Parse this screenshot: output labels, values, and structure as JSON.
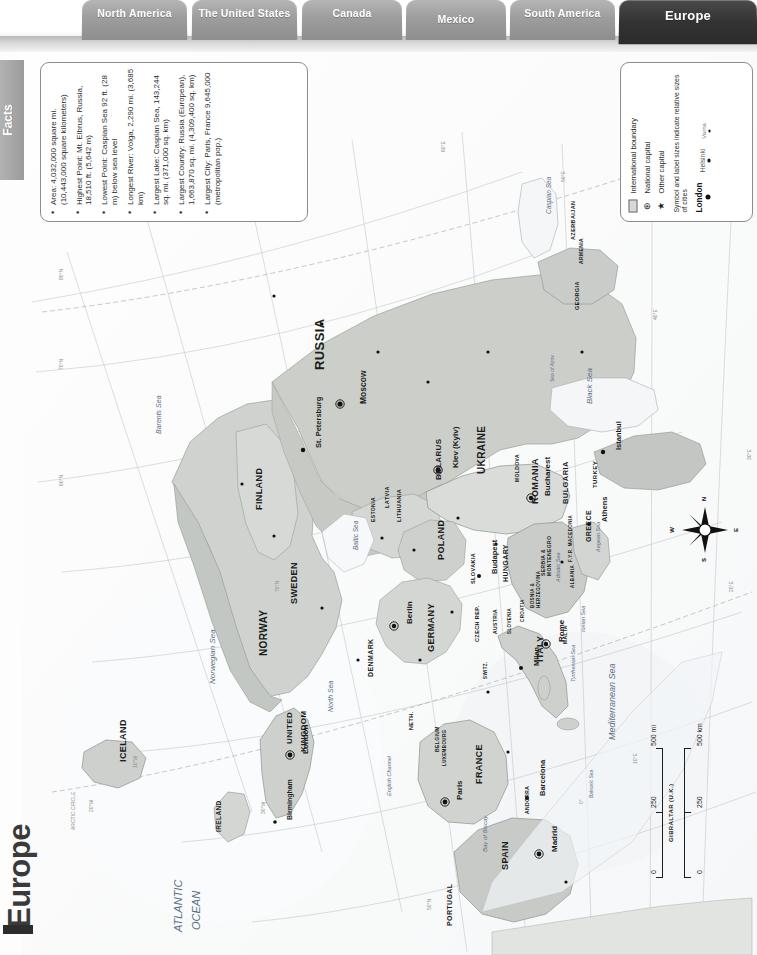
{
  "tabs": [
    {
      "label": "North America",
      "active": false
    },
    {
      "label": "The United States",
      "active": false
    },
    {
      "label": "Canada",
      "active": false
    },
    {
      "label": "Mexico",
      "active": false
    },
    {
      "label": "South America",
      "active": false
    },
    {
      "label": "Europe",
      "active": true
    }
  ],
  "side_tab": {
    "label": "Facts"
  },
  "page_title": "Europe",
  "facts": {
    "items": [
      "Area: 4,032,000 square mi. (10,443,000 square kilometers)",
      "Highest Point: Mt. Elbrus, Russia, 18,510 ft. (5,642 m)",
      "Lowest Point: Caspian Sea 92 ft. (28 m) below sea level",
      "Longest River: Volga, 2,290 mi. (3,685 km)",
      "Largest Lake: Caspian Sea, 143,244 sq. mi. (371,000 sq. km)",
      "Largest Country: Russia (European), 1,663,870 sq. mi. (4,309,400 sq. km)",
      "Largest City: Paris, France 9,645,000 (metropolitan pop.)"
    ]
  },
  "legend": {
    "boundary_label": "International boundary",
    "national_capital_label": "National capital",
    "other_capital_label": "Other capital",
    "note": "Symbol and label sizes indicate relative sizes of cities",
    "cities": [
      {
        "name": "London",
        "size": "big"
      },
      {
        "name": "Helsinki",
        "size": "mid"
      },
      {
        "name": "Varna",
        "size": "small"
      }
    ],
    "national_capital_glyph": "⊛",
    "other_capital_glyph": "★"
  },
  "scale": {
    "miles_ticks": [
      "0",
      "250",
      "500 mi"
    ],
    "km_ticks": [
      "0",
      "250",
      "500 km"
    ]
  },
  "compass": {
    "n": "N",
    "e": "E",
    "s": "S",
    "w": "W"
  },
  "map": {
    "ocean_label_1": "ATLANTIC",
    "ocean_label_2": "OCEAN",
    "countries": [
      {
        "name": "ICELAND",
        "x": 96,
        "y": 710,
        "size": 9,
        "rot": -90
      },
      {
        "name": "IRELAND",
        "x": 193,
        "y": 780,
        "size": 6.5,
        "rot": -90
      },
      {
        "name": "UNITED",
        "x": 263,
        "y": 692,
        "size": 8,
        "rot": -90
      },
      {
        "name": "KINGDOM",
        "x": 277,
        "y": 700,
        "size": 8,
        "rot": -90
      },
      {
        "name": "PORTUGAL",
        "x": 424,
        "y": 874,
        "size": 7,
        "rot": -90
      },
      {
        "name": "SPAIN",
        "x": 478,
        "y": 818,
        "size": 9,
        "rot": -90
      },
      {
        "name": "FRANCE",
        "x": 452,
        "y": 732,
        "size": 9,
        "rot": -90
      },
      {
        "name": "ANDORRA",
        "x": 502,
        "y": 762,
        "size": 5,
        "rot": -90
      },
      {
        "name": "NORWAY",
        "x": 236,
        "y": 604,
        "size": 10,
        "rot": -90
      },
      {
        "name": "SWEDEN",
        "x": 267,
        "y": 552,
        "size": 9,
        "rot": -90
      },
      {
        "name": "FINLAND",
        "x": 232,
        "y": 458,
        "size": 9,
        "rot": -90
      },
      {
        "name": "DENMARK",
        "x": 345,
        "y": 625,
        "size": 7,
        "rot": -90
      },
      {
        "name": "NETH.",
        "x": 386,
        "y": 678,
        "size": 5.5,
        "rot": -90
      },
      {
        "name": "BELGIUM",
        "x": 412,
        "y": 700,
        "size": 5,
        "rot": -90
      },
      {
        "name": "LUXEMBOURG",
        "x": 420,
        "y": 714,
        "size": 4.5,
        "rot": -90
      },
      {
        "name": "GERMANY",
        "x": 404,
        "y": 600,
        "size": 9,
        "rot": -90
      },
      {
        "name": "POLAND",
        "x": 414,
        "y": 508,
        "size": 9,
        "rot": -90
      },
      {
        "name": "CZECH REP.",
        "x": 452,
        "y": 590,
        "size": 5.5,
        "rot": -90
      },
      {
        "name": "SLOVAKIA",
        "x": 448,
        "y": 532,
        "size": 5.5,
        "rot": -90
      },
      {
        "name": "AUSTRIA",
        "x": 470,
        "y": 582,
        "size": 5,
        "rot": -90
      },
      {
        "name": "SWITZ.",
        "x": 461,
        "y": 627,
        "size": 4.5,
        "rot": -90
      },
      {
        "name": "HUNGARY",
        "x": 480,
        "y": 530,
        "size": 7,
        "rot": -90
      },
      {
        "name": "SLOVENIA",
        "x": 485,
        "y": 582,
        "size": 4.5,
        "rot": -90
      },
      {
        "name": "CROATIA",
        "x": 498,
        "y": 570,
        "size": 4.5,
        "rot": -90
      },
      {
        "name": "BOSNIA &",
        "x": 508,
        "y": 556,
        "size": 4.5,
        "rot": -90
      },
      {
        "name": "HERZEGOVINA",
        "x": 514,
        "y": 556,
        "size": 4.5,
        "rot": -90
      },
      {
        "name": "SERBIA &",
        "x": 518,
        "y": 524,
        "size": 5,
        "rot": -90
      },
      {
        "name": "MONTENEGRO",
        "x": 524,
        "y": 524,
        "size": 5,
        "rot": -90
      },
      {
        "name": "ITALY",
        "x": 513,
        "y": 610,
        "size": 9,
        "rot": -90
      },
      {
        "name": "ROMANIA",
        "x": 508,
        "y": 452,
        "size": 9,
        "rot": -90
      },
      {
        "name": "MOLDOVA",
        "x": 492,
        "y": 430,
        "size": 5,
        "rot": -90
      },
      {
        "name": "BULGARIA",
        "x": 539,
        "y": 452,
        "size": 7.5,
        "rot": -90
      },
      {
        "name": "F.Y.R. MACEDONIA",
        "x": 546,
        "y": 510,
        "size": 4.5,
        "rot": -90
      },
      {
        "name": "ALBANIA",
        "x": 548,
        "y": 536,
        "size": 4.5,
        "rot": -90
      },
      {
        "name": "GREECE",
        "x": 563,
        "y": 490,
        "size": 7,
        "rot": -90
      },
      {
        "name": "TURKEY",
        "x": 570,
        "y": 436,
        "size": 6,
        "rot": -90
      },
      {
        "name": "UKRAINE",
        "x": 454,
        "y": 422,
        "size": 10,
        "rot": -90
      },
      {
        "name": "BELARUS",
        "x": 412,
        "y": 428,
        "size": 8,
        "rot": -90
      },
      {
        "name": "LITHUANIA",
        "x": 374,
        "y": 470,
        "size": 5.5,
        "rot": -90
      },
      {
        "name": "LATVIA",
        "x": 362,
        "y": 456,
        "size": 5.5,
        "rot": -90
      },
      {
        "name": "ESTONIA",
        "x": 348,
        "y": 470,
        "size": 5,
        "rot": -90
      },
      {
        "name": "RUSSIA",
        "x": 290,
        "y": 318,
        "size": 13,
        "rot": -90
      },
      {
        "name": "GEORGIA",
        "x": 552,
        "y": 258,
        "size": 5.5,
        "rot": -90
      },
      {
        "name": "ARMENIA",
        "x": 556,
        "y": 212,
        "size": 5,
        "rot": -90
      },
      {
        "name": "AZERBAIJAN",
        "x": 548,
        "y": 188,
        "size": 5.5,
        "rot": -90
      },
      {
        "name": "MALTA",
        "x": 540,
        "y": 592,
        "size": 5,
        "rot": -90
      },
      {
        "name": "GIBRALTAR (U.K.)",
        "x": 646,
        "y": 790,
        "size": 6,
        "rot": -90
      }
    ],
    "capitals": [
      {
        "name": "Moscow",
        "x": 336,
        "y": 352,
        "size": 8.5
      },
      {
        "name": "Kiev (Kyiv)",
        "x": 429,
        "y": 416,
        "size": 8
      },
      {
        "name": "London",
        "x": 279,
        "y": 702,
        "size": 8
      },
      {
        "name": "Paris",
        "x": 433,
        "y": 748,
        "size": 8
      },
      {
        "name": "Madrid",
        "x": 528,
        "y": 800,
        "size": 8
      },
      {
        "name": "Berlin",
        "x": 383,
        "y": 572,
        "size": 8
      },
      {
        "name": "Rome",
        "x": 535,
        "y": 590,
        "size": 8
      },
      {
        "name": "Bucharest",
        "x": 521,
        "y": 444,
        "size": 8
      },
      {
        "name": "Budapest",
        "x": 468,
        "y": 522,
        "size": 7.5
      },
      {
        "name": "Athens",
        "x": 578,
        "y": 470,
        "size": 7.5
      },
      {
        "name": "St. Petersburg",
        "x": 292,
        "y": 396,
        "size": 7.5
      },
      {
        "name": "Istanbul",
        "x": 592,
        "y": 398,
        "size": 7.5
      },
      {
        "name": "Milan",
        "x": 510,
        "y": 614,
        "size": 7.5
      },
      {
        "name": "Barcelona",
        "x": 516,
        "y": 744,
        "size": 7.5
      },
      {
        "name": "Birmingham",
        "x": 264,
        "y": 768,
        "size": 7
      }
    ],
    "seas": [
      {
        "name": "Norwegian Sea",
        "x": 186,
        "y": 632,
        "size": 8
      },
      {
        "name": "North Sea",
        "x": 305,
        "y": 660,
        "size": 7
      },
      {
        "name": "Baltic Sea",
        "x": 330,
        "y": 498,
        "size": 6.5
      },
      {
        "name": "Barents Sea",
        "x": 133,
        "y": 382,
        "size": 7
      },
      {
        "name": "Black Sea",
        "x": 563,
        "y": 352,
        "size": 8
      },
      {
        "name": "Caspian Sea",
        "x": 523,
        "y": 162,
        "size": 6.5
      },
      {
        "name": "Mediterranean Sea",
        "x": 585,
        "y": 688,
        "size": 9
      },
      {
        "name": "Adriatic Sea",
        "x": 533,
        "y": 530,
        "size": 5.5
      },
      {
        "name": "Aegean Sea",
        "x": 573,
        "y": 500,
        "size": 5.5
      },
      {
        "name": "Tyrrhenian Sea",
        "x": 548,
        "y": 630,
        "size": 5.5
      },
      {
        "name": "Ionian Sea",
        "x": 558,
        "y": 580,
        "size": 5.5
      },
      {
        "name": "Bay of Biscay",
        "x": 460,
        "y": 800,
        "size": 6
      },
      {
        "name": "English Channel",
        "x": 364,
        "y": 744,
        "size": 5.5
      },
      {
        "name": "Sea of Azov",
        "x": 527,
        "y": 330,
        "size": 5
      },
      {
        "name": "Balearic Sea",
        "x": 566,
        "y": 746,
        "size": 5
      }
    ],
    "graticule_labels": [
      {
        "t": "80°N",
        "x": 36,
        "y": 228
      },
      {
        "t": "70°N",
        "x": 36,
        "y": 318
      },
      {
        "t": "60°N",
        "x": 36,
        "y": 434
      },
      {
        "t": "70°N",
        "x": 252,
        "y": 540
      },
      {
        "t": "ARCTIC CIRCLE",
        "x": 48,
        "y": 778
      },
      {
        "t": "10°W",
        "x": 110,
        "y": 716
      },
      {
        "t": "20°W",
        "x": 66,
        "y": 760
      },
      {
        "t": "30°W",
        "x": 238,
        "y": 762
      },
      {
        "t": "50°N",
        "x": 404,
        "y": 858
      },
      {
        "t": "10°W",
        "x": 424,
        "y": 916
      },
      {
        "t": "0°",
        "x": 556,
        "y": 752
      },
      {
        "t": "10°E",
        "x": 610,
        "y": 712
      },
      {
        "t": "20°E",
        "x": 706,
        "y": 540
      },
      {
        "t": "30°E",
        "x": 724,
        "y": 408
      },
      {
        "t": "40°E",
        "x": 630,
        "y": 268
      },
      {
        "t": "50°E",
        "x": 538,
        "y": 130
      },
      {
        "t": "60°E",
        "x": 418,
        "y": 100
      },
      {
        "t": "40°N",
        "x": 684,
        "y": 92
      }
    ]
  }
}
